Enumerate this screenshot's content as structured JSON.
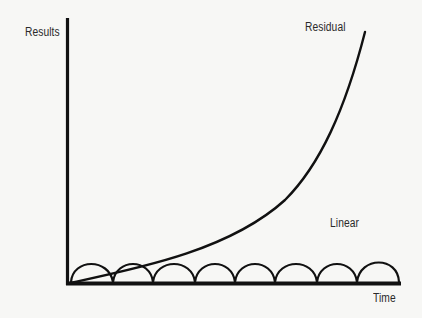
{
  "diagram": {
    "y_axis_label": "Results",
    "x_axis_label": "Time",
    "curves": [
      {
        "name": "Residual",
        "label": "Residual",
        "shape": "exponential"
      },
      {
        "name": "Linear",
        "label": "Linear",
        "shape": "repeating-arches",
        "arch_count": 8
      }
    ],
    "colors": {
      "background": "#f7f7f5",
      "ink": "#111111"
    }
  }
}
